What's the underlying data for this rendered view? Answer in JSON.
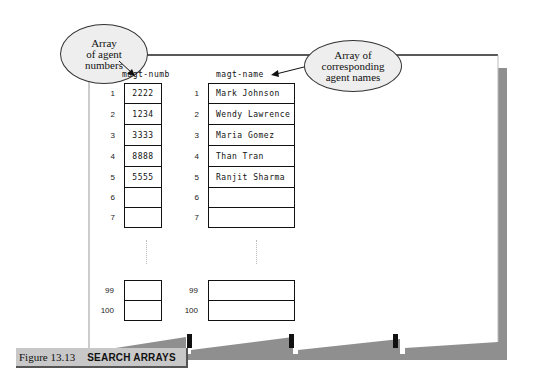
{
  "callouts": {
    "left": {
      "lines": [
        "Array",
        "of agent",
        "numbers"
      ]
    },
    "right": {
      "lines": [
        "Array of",
        "corresponding",
        "agent names"
      ]
    }
  },
  "arrays": {
    "numbers": {
      "name": "magt-numb",
      "rows": [
        {
          "index": "1",
          "value": "2222"
        },
        {
          "index": "2",
          "value": "1234"
        },
        {
          "index": "3",
          "value": "3333"
        },
        {
          "index": "4",
          "value": "8888"
        },
        {
          "index": "5",
          "value": "5555"
        },
        {
          "index": "6",
          "value": ""
        },
        {
          "index": "7",
          "value": ""
        },
        {
          "index": "99",
          "value": ""
        },
        {
          "index": "100",
          "value": ""
        }
      ]
    },
    "names": {
      "name": "magt-name",
      "rows": [
        {
          "index": "1",
          "value": "Mark Johnson"
        },
        {
          "index": "2",
          "value": "Wendy Lawrence"
        },
        {
          "index": "3",
          "value": "Maria Gomez"
        },
        {
          "index": "4",
          "value": "Than Tran"
        },
        {
          "index": "5",
          "value": "Ranjit Sharma"
        },
        {
          "index": "6",
          "value": ""
        },
        {
          "index": "7",
          "value": ""
        },
        {
          "index": "99",
          "value": ""
        },
        {
          "index": "100",
          "value": ""
        }
      ]
    }
  },
  "caption": {
    "figure": "Figure 13.13",
    "title": "SEARCH ARRAYS"
  },
  "colors": {
    "shadow": "#8f8f8f",
    "caption_bg": "#c8c8c8",
    "bubble_bg": "#eeeeee"
  }
}
